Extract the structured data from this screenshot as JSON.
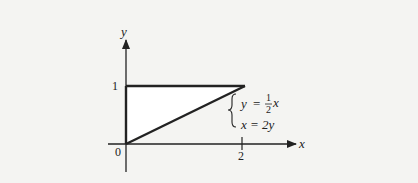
{
  "diagram": {
    "axes": {
      "x_label": "x",
      "y_label": "y",
      "origin_label": "0",
      "x_tick_label": "2",
      "y_tick_label": "1"
    },
    "region": {
      "description": "Triangle bounded by x=0, y=1, and y = x/2",
      "vertices": [
        [
          0,
          0
        ],
        [
          0,
          1
        ],
        [
          2,
          1
        ]
      ]
    },
    "equations": {
      "eq1_lhs": "y",
      "eq1_eq": "=",
      "eq1_num": "1",
      "eq1_den": "2",
      "eq1_var": "x",
      "eq2": "x = 2y"
    },
    "colors": {
      "background": "#f4f4f2",
      "fill": "#ffffff",
      "line": "#2a2a2a"
    }
  }
}
